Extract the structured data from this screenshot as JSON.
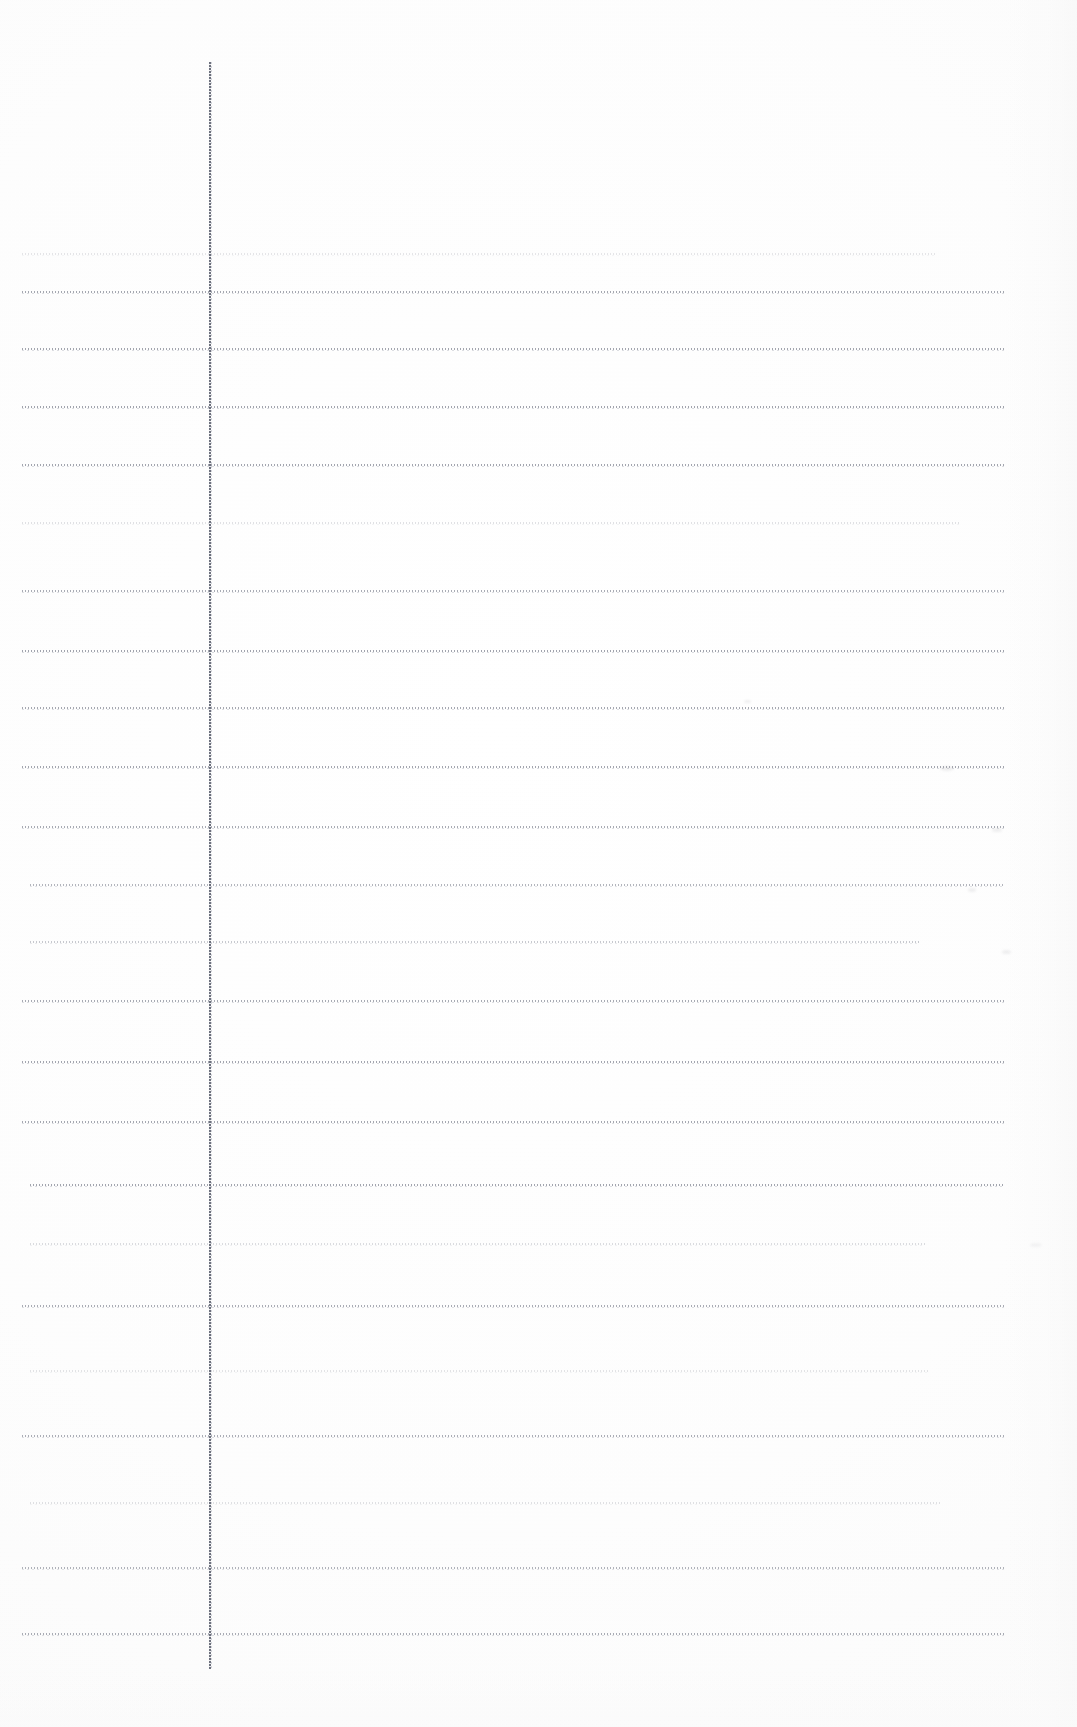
{
  "document": {
    "kind": "scanned-ruled-notebook-page",
    "orientation": "portrait",
    "page_width_px": 1077,
    "page_height_px": 1727,
    "visible_text": "",
    "handwriting_present": false,
    "printed_text_present": false
  },
  "colors": {
    "paper_background": "#fdfdfd",
    "page_white": "#ffffff",
    "rule_line": "#787c8a",
    "rule_line_soft": "#969aa6",
    "margin_rule": "#606472",
    "right_edge_tint": "#f8f8f8"
  },
  "margin_rule": {
    "name": "vertical-margin-line",
    "x": 209,
    "top": 62,
    "bottom": 1669,
    "thickness_px": 2,
    "style": "dotted-scan"
  },
  "ruling": {
    "first_line_y": 253,
    "line_spacing_px": 65.7,
    "line_count": 22,
    "left_x": 22,
    "right_x": 1005,
    "style": "dotted-scan",
    "lines": [
      {
        "index": 1,
        "y": 253,
        "left": 22,
        "right": 935,
        "opacity": 0.22
      },
      {
        "index": 2,
        "y": 291,
        "left": 22,
        "right": 1005,
        "opacity": 0.78
      },
      {
        "index": 3,
        "y": 348,
        "left": 22,
        "right": 1005,
        "opacity": 0.8
      },
      {
        "index": 4,
        "y": 406,
        "left": 22,
        "right": 1005,
        "opacity": 0.82
      },
      {
        "index": 5,
        "y": 464,
        "left": 22,
        "right": 1005,
        "opacity": 0.8
      },
      {
        "index": 6,
        "y": 522,
        "left": 22,
        "right": 960,
        "opacity": 0.26
      },
      {
        "index": 7,
        "y": 590,
        "left": 22,
        "right": 1005,
        "opacity": 0.74
      },
      {
        "index": 8,
        "y": 650,
        "left": 22,
        "right": 1005,
        "opacity": 0.82
      },
      {
        "index": 9,
        "y": 707,
        "left": 22,
        "right": 1005,
        "opacity": 0.78
      },
      {
        "index": 10,
        "y": 766,
        "left": 22,
        "right": 1005,
        "opacity": 0.8
      },
      {
        "index": 11,
        "y": 826,
        "left": 22,
        "right": 1005,
        "opacity": 0.76
      },
      {
        "index": 12,
        "y": 884,
        "left": 30,
        "right": 1005,
        "opacity": 0.66
      },
      {
        "index": 13,
        "y": 941,
        "left": 30,
        "right": 920,
        "opacity": 0.48
      },
      {
        "index": 14,
        "y": 1000,
        "left": 22,
        "right": 1005,
        "opacity": 0.76
      },
      {
        "index": 15,
        "y": 1061,
        "left": 22,
        "right": 1005,
        "opacity": 0.8
      },
      {
        "index": 16,
        "y": 1121,
        "left": 22,
        "right": 1005,
        "opacity": 0.78
      },
      {
        "index": 17,
        "y": 1184,
        "left": 30,
        "right": 1005,
        "opacity": 0.8
      },
      {
        "index": 18,
        "y": 1243,
        "left": 30,
        "right": 925,
        "opacity": 0.3
      },
      {
        "index": 19,
        "y": 1305,
        "left": 22,
        "right": 1005,
        "opacity": 0.74
      },
      {
        "index": 20,
        "y": 1370,
        "left": 30,
        "right": 930,
        "opacity": 0.24
      },
      {
        "index": 21,
        "y": 1435,
        "left": 22,
        "right": 1005,
        "opacity": 0.72
      },
      {
        "index": 22,
        "y": 1502,
        "left": 30,
        "right": 940,
        "opacity": 0.26
      },
      {
        "index": 23,
        "y": 1567,
        "left": 22,
        "right": 1005,
        "opacity": 0.68
      },
      {
        "index": 24,
        "y": 1633,
        "left": 22,
        "right": 1005,
        "opacity": 0.74
      }
    ]
  },
  "scan_artifacts": {
    "right_edge_band_width": 72,
    "bottom_blank_band_height": 58,
    "smudges": [
      {
        "x": 940,
        "y": 766,
        "w": 14,
        "h": 5
      },
      {
        "x": 992,
        "y": 828,
        "w": 10,
        "h": 4
      },
      {
        "x": 968,
        "y": 888,
        "w": 8,
        "h": 4
      },
      {
        "x": 1002,
        "y": 950,
        "w": 9,
        "h": 4
      },
      {
        "x": 744,
        "y": 700,
        "w": 7,
        "h": 3
      },
      {
        "x": 1030,
        "y": 1243,
        "w": 12,
        "h": 4
      }
    ]
  }
}
